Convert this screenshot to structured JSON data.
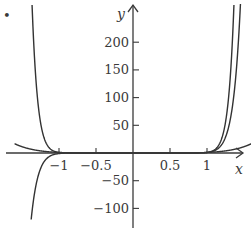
{
  "chart_data": {
    "type": "line",
    "title": "",
    "xlabel": "x",
    "ylabel": "y",
    "xlim": [
      -1.6,
      1.6
    ],
    "ylim": [
      -125,
      270
    ],
    "x_ticks": [
      {
        "value": -1,
        "label": "−1"
      },
      {
        "value": -0.5,
        "label": "−0.5"
      },
      {
        "value": 0.5,
        "label": "0.5"
      },
      {
        "value": 1,
        "label": "1"
      }
    ],
    "y_ticks": [
      {
        "value": 200,
        "label": "200"
      },
      {
        "value": 150,
        "label": "150"
      },
      {
        "value": 100,
        "label": "100"
      },
      {
        "value": 50,
        "label": "50"
      },
      {
        "value": -50,
        "label": "−50"
      },
      {
        "value": -100,
        "label": "−100"
      }
    ],
    "grid": false,
    "legend": "none",
    "marker": "•",
    "series": [
      {
        "name": "even power (approx. x^18)",
        "exponent": 18
      },
      {
        "name": "odd power (approx. x^15)",
        "exponent": 15
      },
      {
        "name": "low power (approx. x^6)",
        "exponent": 6
      }
    ],
    "colors": {
      "curve": "#333333",
      "axis": "#3a3a3a"
    }
  }
}
